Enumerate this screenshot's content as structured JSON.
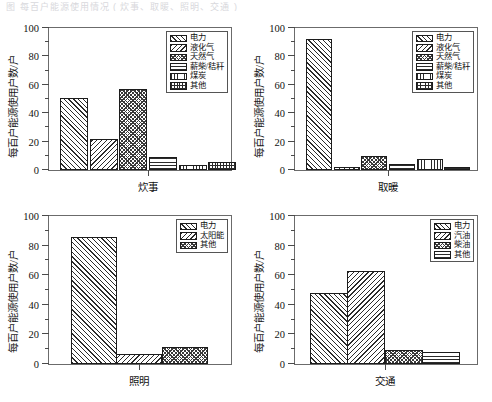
{
  "top_fragment": "图 每百户能源使用情况 ( 炊事、取暖、照明、交通 )",
  "axis": {
    "y_label": "每百户能源使用户数/户",
    "y_ticks": [
      0,
      20,
      40,
      60,
      80,
      100
    ],
    "y_min": 0,
    "y_max": 100
  },
  "colors": {
    "axis": "#4a4a4a",
    "frame": "#6b6b6b",
    "bar_edge": "#1c1c1c",
    "hatch": "#2b2b2b",
    "background": "#ffffff"
  },
  "chart_data": [
    {
      "type": "bar",
      "id": "cooking",
      "title": "",
      "xlabel": "炊事",
      "ylabel": "每百户能源使用户数/户",
      "ylim": [
        0,
        100
      ],
      "grid": false,
      "legend_position": "upper right",
      "categories": [
        "电力",
        "液化气",
        "天然气",
        "薪柴/秸秆",
        "煤炭",
        "其他"
      ],
      "values": [
        50.5,
        21.5,
        57,
        9.5,
        3.8,
        5.8
      ],
      "patterns": [
        "diagonal",
        "reverse-diagonal",
        "checker",
        "horizontal",
        "vertical",
        "grid"
      ]
    },
    {
      "type": "bar",
      "id": "heating",
      "title": "",
      "xlabel": "取暖",
      "ylabel": "每百户能源使用户数/户",
      "ylim": [
        0,
        100
      ],
      "grid": false,
      "legend_position": "upper right",
      "categories": [
        "电力",
        "液化气",
        "天然气",
        "薪柴/秸秆",
        "煤炭",
        "其他"
      ],
      "values": [
        92,
        1.8,
        10,
        4.5,
        8,
        2
      ],
      "patterns": [
        "diagonal",
        "reverse-diagonal",
        "checker",
        "horizontal",
        "vertical",
        "grid"
      ]
    },
    {
      "type": "bar",
      "id": "lighting",
      "title": "",
      "xlabel": "照明",
      "ylabel": "每百户能源使用户数/户",
      "ylim": [
        0,
        100
      ],
      "grid": false,
      "legend_position": "upper right",
      "categories": [
        "电力",
        "太阳能",
        "其他"
      ],
      "values": [
        86,
        7,
        11.5
      ],
      "patterns": [
        "diagonal",
        "reverse-diagonal",
        "checker"
      ]
    },
    {
      "type": "bar",
      "id": "transport",
      "title": "",
      "xlabel": "交通",
      "ylabel": "每百户能源使用户数/户",
      "ylim": [
        0,
        100
      ],
      "grid": false,
      "legend_position": "upper right",
      "categories": [
        "电力",
        "汽油",
        "柴油",
        "其他"
      ],
      "values": [
        48,
        63,
        9.5,
        8
      ],
      "patterns": [
        "diagonal",
        "reverse-diagonal",
        "checker",
        "horizontal"
      ]
    }
  ]
}
